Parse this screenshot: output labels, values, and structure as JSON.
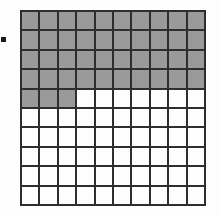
{
  "figure": {
    "background_color": "#fdfdfd"
  },
  "bullet": {
    "name": "bullet-marker",
    "shape": "square",
    "color": "#1a1a1a",
    "size_px": 5
  },
  "grid": {
    "rows": 10,
    "columns": 10,
    "total_cells": 100,
    "shaded_cells": 43,
    "unshaded_cells": 57,
    "shaded_color": "#9a9a9a",
    "unshaded_color": "#fefefe",
    "line_color": "#2e2e2e",
    "line_width_px": 2,
    "fraction_shaded": "43/100",
    "percent_shaded": "43%",
    "decimal_shaded": "0.43",
    "shaded_per_row": [
      10,
      10,
      10,
      10,
      3,
      0,
      0,
      0,
      0,
      0
    ],
    "cells": [
      [
        1,
        1,
        1,
        1,
        1,
        1,
        1,
        1,
        1,
        1
      ],
      [
        1,
        1,
        1,
        1,
        1,
        1,
        1,
        1,
        1,
        1
      ],
      [
        1,
        1,
        1,
        1,
        1,
        1,
        1,
        1,
        1,
        1
      ],
      [
        1,
        1,
        1,
        1,
        1,
        1,
        1,
        1,
        1,
        1
      ],
      [
        1,
        1,
        1,
        0,
        0,
        0,
        0,
        0,
        0,
        0
      ],
      [
        0,
        0,
        0,
        0,
        0,
        0,
        0,
        0,
        0,
        0
      ],
      [
        0,
        0,
        0,
        0,
        0,
        0,
        0,
        0,
        0,
        0
      ],
      [
        0,
        0,
        0,
        0,
        0,
        0,
        0,
        0,
        0,
        0
      ],
      [
        0,
        0,
        0,
        0,
        0,
        0,
        0,
        0,
        0,
        0
      ],
      [
        0,
        0,
        0,
        0,
        0,
        0,
        0,
        0,
        0,
        0
      ]
    ]
  },
  "chart_data": {
    "type": "heatmap",
    "title": "",
    "xlabel": "",
    "ylabel": "",
    "rows": 10,
    "columns": 10,
    "legend": [
      {
        "label": "shaded",
        "value": 1,
        "color": "#9a9a9a",
        "count": 43
      },
      {
        "label": "unshaded",
        "value": 0,
        "color": "#fefefe",
        "count": 57
      }
    ],
    "values": [
      [
        1,
        1,
        1,
        1,
        1,
        1,
        1,
        1,
        1,
        1
      ],
      [
        1,
        1,
        1,
        1,
        1,
        1,
        1,
        1,
        1,
        1
      ],
      [
        1,
        1,
        1,
        1,
        1,
        1,
        1,
        1,
        1,
        1
      ],
      [
        1,
        1,
        1,
        1,
        1,
        1,
        1,
        1,
        1,
        1
      ],
      [
        1,
        1,
        1,
        0,
        0,
        0,
        0,
        0,
        0,
        0
      ],
      [
        0,
        0,
        0,
        0,
        0,
        0,
        0,
        0,
        0,
        0
      ],
      [
        0,
        0,
        0,
        0,
        0,
        0,
        0,
        0,
        0,
        0
      ],
      [
        0,
        0,
        0,
        0,
        0,
        0,
        0,
        0,
        0,
        0
      ],
      [
        0,
        0,
        0,
        0,
        0,
        0,
        0,
        0,
        0,
        0
      ],
      [
        0,
        0,
        0,
        0,
        0,
        0,
        0,
        0,
        0,
        0
      ]
    ],
    "grid": true,
    "annotations": []
  }
}
